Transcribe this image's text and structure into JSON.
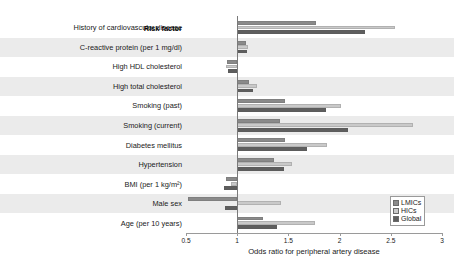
{
  "chart_data": {
    "type": "bar",
    "orientation": "horizontal",
    "title": "",
    "xlabel": "Odds ratio for peripheral artery disease",
    "ylabel": "Risk factor",
    "categories_header": "Risk factor",
    "categories": [
      "History of cardiovascular disease",
      "C-reactive protein (per 1 mg/dl)",
      "High HDL cholesterol",
      "High total cholesterol",
      "Smoking (past)",
      "Smoking (current)",
      "Diabetes mellitus",
      "Hypertension",
      "BMI (per 1 kg/m²)",
      "Male sex",
      "Age (per 10 years)"
    ],
    "series": [
      {
        "name": "LMICs",
        "color": "#8a8a8a",
        "values": [
          1.77,
          1.09,
          0.9,
          1.12,
          1.47,
          1.42,
          1.47,
          1.36,
          0.89,
          0.52,
          1.25
        ]
      },
      {
        "name": "HICs",
        "color": "#c9c9c9",
        "values": [
          2.54,
          1.11,
          0.89,
          1.19,
          2.01,
          2.72,
          1.88,
          1.54,
          0.94,
          1.43,
          1.76
        ]
      },
      {
        "name": "Global",
        "color": "#5e5e5e",
        "values": [
          2.25,
          1.1,
          0.91,
          1.15,
          1.87,
          2.08,
          1.68,
          1.46,
          0.87,
          0.88,
          1.39
        ]
      }
    ],
    "xlim": [
      0.5,
      3
    ],
    "xticks": [
      0.5,
      1,
      1.5,
      2,
      2.5,
      3
    ],
    "xticklabels": [
      "0.5",
      "1",
      "1.5",
      "2",
      "2.5",
      "3"
    ],
    "reference_line": 1,
    "grid": false,
    "legend_position": "lower-right",
    "legend_entries": [
      "LMICs",
      "HICs",
      "Global"
    ],
    "row_banding": true,
    "band_color": "#ebebeb"
  }
}
